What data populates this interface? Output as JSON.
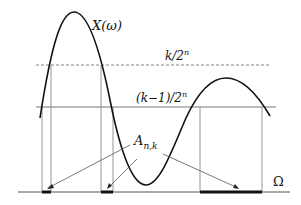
{
  "figure": {
    "curve_label": "X(ω)",
    "upper_level_label": "k/2",
    "upper_level_exp": "n",
    "lower_level_label": "(k−1)/2",
    "lower_level_exp": "n",
    "set_label_main": "A",
    "set_label_sub": "n,k",
    "axis_label": "Ω"
  },
  "colors": {
    "curve": "#111111",
    "guide": "#8a8a8a",
    "axis": "#555555",
    "highlight": "#111111"
  }
}
